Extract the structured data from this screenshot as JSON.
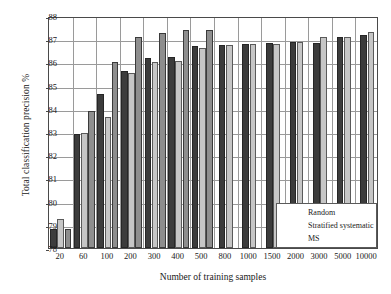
{
  "chart_data": {
    "type": "bar",
    "title": "",
    "xlabel": "Number of training samples",
    "ylabel": "Total classification precision %",
    "categories": [
      "20",
      "60",
      "100",
      "200",
      "300",
      "400",
      "500",
      "800",
      "1000",
      "1500",
      "2000",
      "3000",
      "5000",
      "10000"
    ],
    "ylim": [
      78,
      88
    ],
    "yticks": [
      "78",
      "79",
      "80",
      "81",
      "82",
      "83",
      "84",
      "85",
      "86",
      "87",
      "88"
    ],
    "grid": true,
    "legend_position": "lower-right",
    "series": [
      {
        "name": "Random",
        "color": "#3c3c3c",
        "values": [
          78.8,
          82.9,
          84.65,
          85.65,
          86.2,
          86.25,
          86.7,
          86.75,
          86.8,
          86.85,
          86.9,
          86.85,
          87.1,
          87.2
        ]
      },
      {
        "name": "Stratified systematic",
        "color": "#c6c6c6",
        "values": [
          79.25,
          82.95,
          83.65,
          85.55,
          86.0,
          86.05,
          86.6,
          86.75,
          86.8,
          86.8,
          86.9,
          87.1,
          87.1,
          87.3
        ]
      },
      {
        "name": "MS",
        "color": "#8e8e8e",
        "values": [
          78.8,
          83.9,
          86.0,
          87.1,
          87.25,
          87.4,
          87.4,
          null,
          null,
          null,
          null,
          null,
          null,
          null
        ]
      }
    ]
  },
  "legend": {
    "items": [
      {
        "label": "Random",
        "swatch": "series-0-swatch"
      },
      {
        "label": "Stratified systematic",
        "swatch": "series-1-swatch"
      },
      {
        "label": "MS",
        "swatch": "series-2-swatch"
      }
    ]
  }
}
